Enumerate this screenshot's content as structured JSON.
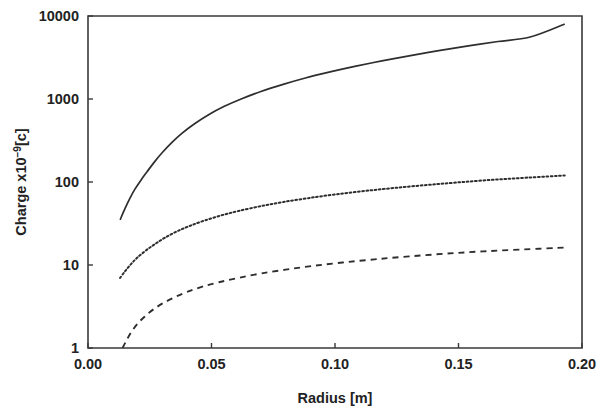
{
  "chart_data": {
    "type": "line",
    "title": "",
    "xlabel": "Radius [m]",
    "ylabel": "Charge x10−9[c]",
    "ylabel_parts": {
      "prefix": "Charge x10",
      "exponent": "−9",
      "suffix": "[c]"
    },
    "xscale": "linear",
    "yscale": "log",
    "xlim": [
      0.0,
      0.2
    ],
    "ylim": [
      1,
      10000
    ],
    "grid": false,
    "legend": "none",
    "xticks": [
      0.0,
      0.05,
      0.1,
      0.15,
      0.2
    ],
    "xtick_labels": [
      "0.00",
      "0.05",
      "0.10",
      "0.15",
      "0.20"
    ],
    "yticks": [
      1,
      10,
      100,
      1000,
      10000
    ],
    "ytick_labels": [
      "1",
      "10",
      "100",
      "1000",
      "10000"
    ],
    "series": [
      {
        "name": "upper-solid-curve",
        "style": "solid",
        "x": [
          0.013,
          0.015,
          0.017,
          0.019,
          0.0215,
          0.024,
          0.027,
          0.03,
          0.034,
          0.038,
          0.043,
          0.049,
          0.055,
          0.062,
          0.07,
          0.079,
          0.088,
          0.098,
          0.108,
          0.119,
          0.13,
          0.142,
          0.154,
          0.166,
          0.179,
          0.193
        ],
        "y": [
          35,
          48,
          64,
          82,
          106,
          134,
          176,
          225,
          300,
          385,
          500,
          650,
          810,
          1000,
          1230,
          1500,
          1790,
          2120,
          2470,
          2880,
          3310,
          3820,
          4360,
          4930,
          5580,
          8000
        ]
      },
      {
        "name": "middle-dotted-curve",
        "style": "dotted",
        "x": [
          0.013,
          0.015,
          0.0175,
          0.02,
          0.0235,
          0.027,
          0.031,
          0.036,
          0.041,
          0.047,
          0.054,
          0.061,
          0.07,
          0.079,
          0.089,
          0.1,
          0.112,
          0.124,
          0.137,
          0.15,
          0.164,
          0.178,
          0.193
        ],
        "y": [
          7.0,
          8.4,
          10.3,
          12.3,
          15.0,
          17.8,
          21.2,
          25.4,
          29.4,
          34.2,
          39.6,
          44.8,
          51.2,
          57.4,
          63.8,
          70.8,
          78.0,
          84.8,
          92.0,
          99.0,
          106.5,
          113.0,
          120.0
        ]
      },
      {
        "name": "lower-dashed-curve",
        "style": "dashed",
        "x": [
          0.014,
          0.0155,
          0.0175,
          0.02,
          0.023,
          0.0265,
          0.0305,
          0.035,
          0.04,
          0.046,
          0.053,
          0.061,
          0.07,
          0.08,
          0.091,
          0.103,
          0.116,
          0.13,
          0.145,
          0.16,
          0.176,
          0.193
        ],
        "y": [
          1.0,
          1.22,
          1.55,
          1.95,
          2.4,
          2.92,
          3.48,
          4.08,
          4.72,
          5.45,
          6.2,
          7.0,
          7.9,
          8.8,
          9.75,
          10.7,
          11.7,
          12.7,
          13.7,
          14.6,
          15.4,
          16.2
        ]
      }
    ]
  },
  "axes_geometry": {
    "left_px": 88,
    "right_px": 582,
    "top_px": 16,
    "bottom_px": 348
  }
}
